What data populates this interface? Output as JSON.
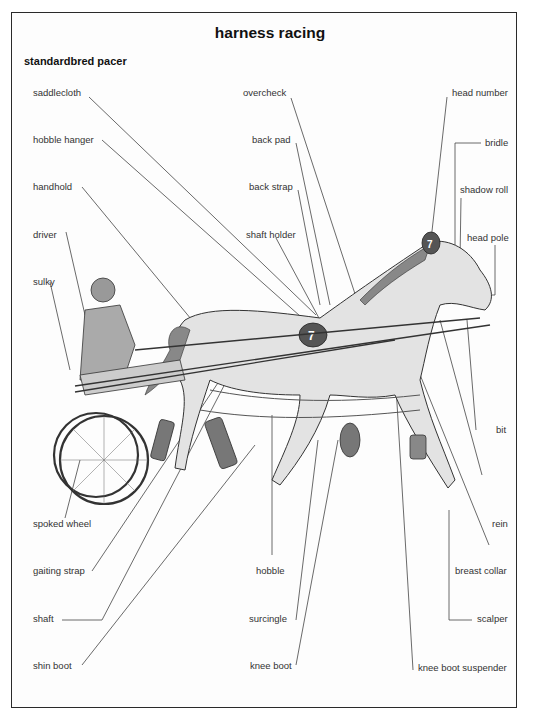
{
  "title": "harness racing",
  "subtitle": "standardbred pacer",
  "labels": {
    "left": [
      "saddlecloth",
      "hobble hanger",
      "handhold",
      "driver",
      "sulky",
      "spoked wheel",
      "gaiting strap",
      "shaft",
      "shin boot"
    ],
    "center_top": [
      "overcheck",
      "back pad",
      "back strap",
      "shaft holder"
    ],
    "center_bottom": [
      "hobble",
      "surcingle",
      "knee boot"
    ],
    "right": [
      "head number",
      "bridle",
      "shadow roll",
      "head pole",
      "bit",
      "rein",
      "breast collar",
      "scalper",
      "knee boot suspender"
    ]
  },
  "head_number_value": "7",
  "saddlecloth_number_value": "7",
  "colors": {
    "horse_fill": "#e3e3e3",
    "equipment_dark": "#6a6a6a",
    "line": "#333333"
  }
}
